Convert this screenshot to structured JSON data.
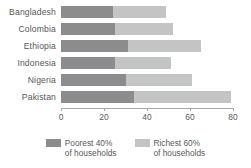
{
  "chart_data": {
    "type": "bar",
    "orientation": "horizontal",
    "stacked": true,
    "title": "",
    "subtitle": "",
    "xlabel": "",
    "ylabel": "",
    "categories": [
      "Bangladesh",
      "Colombia",
      "Ethiopia",
      "Indonesia",
      "Nigeria",
      "Pakistan"
    ],
    "series": [
      {
        "name": "Poorest 40%",
        "legend_line1": "Poorest 40%",
        "legend_line2": "of households",
        "color": "#8c8c8e",
        "values": [
          24,
          25,
          31,
          25,
          30,
          34
        ]
      },
      {
        "name": "Richest 60%",
        "legend_line1": "Richest 60%",
        "legend_line2": "of households",
        "color": "#c3c4c4",
        "values": [
          25,
          27,
          34,
          26,
          31,
          45
        ]
      }
    ],
    "totals": [
      49,
      52,
      65,
      51,
      61,
      79
    ],
    "xlim": [
      0,
      80
    ],
    "xticks": [
      0,
      20,
      40,
      60,
      80
    ],
    "xtick_labels": [
      "0",
      "20",
      "40",
      "60",
      "80"
    ],
    "grid": false,
    "legend_position": "bottom-center",
    "axis_color": "#a8a8aa",
    "text_color": "#58585a",
    "background": "#ffffff"
  }
}
